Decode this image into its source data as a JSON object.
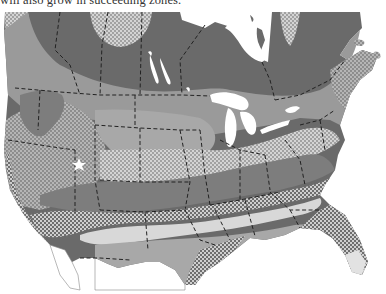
{
  "caption": "will also grow in succeeding zones.",
  "map": {
    "title": "Plant hardiness zones of North America",
    "region": "United States and southern Canada",
    "style": "grayscale with stipple patterns",
    "zones": [
      {
        "name": "zone-1-2",
        "fill": "#6a6a6a",
        "pattern": "solid-dark"
      },
      {
        "name": "zone-3",
        "fill": "#cfcfcf",
        "pattern": "light-dots"
      },
      {
        "name": "zone-4",
        "fill": "#9a9a9a",
        "pattern": "solid-mid"
      },
      {
        "name": "zone-5",
        "fill": "#b8b8b8",
        "pattern": "dots"
      },
      {
        "name": "zone-6",
        "fill": "#7d7d7d",
        "pattern": "solid-darkmid"
      },
      {
        "name": "zone-7",
        "fill": "#8a8a8a",
        "pattern": "white-dots"
      },
      {
        "name": "zone-8",
        "fill": "#d8d8d8",
        "pattern": "solid-light"
      },
      {
        "name": "zone-9",
        "fill": "#a8a8a8",
        "pattern": "solid-mid-light"
      },
      {
        "name": "zone-10",
        "fill": "#e2e2e2",
        "pattern": "solid-pale"
      }
    ],
    "marker": {
      "symbol": "star",
      "label": "star-marker"
    },
    "borders": "dashed state and province lines"
  }
}
